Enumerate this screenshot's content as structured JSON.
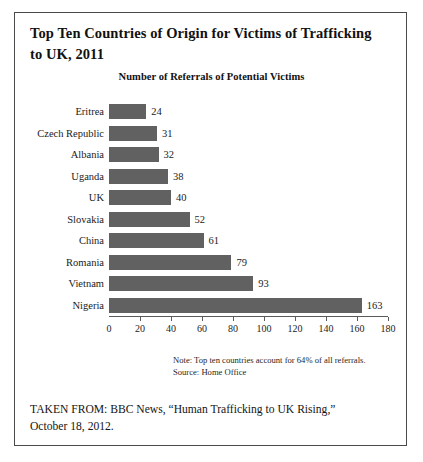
{
  "figure": {
    "title": "Top Ten Countries of Origin for Victims of Trafficking to UK, 2011",
    "note_line1": "Note: Top ten countries account for 64% of all referrals.",
    "note_line2": "Source: Home Office",
    "caption_line1": "TAKEN FROM: BBC News, “Human Trafficking to UK Rising,”",
    "caption_line2": "October 18, 2012.",
    "border_color": "#4a4a4a"
  },
  "chart_data": {
    "type": "bar",
    "orientation": "horizontal",
    "title": "Top Ten Countries of Origin for Victims of Trafficking to UK, 2011",
    "subtitle": "Number of Referrals of Potential Victims",
    "categories": [
      "Eritrea",
      "Czech Republic",
      "Albania",
      "Uganda",
      "UK",
      "Slovakia",
      "China",
      "Romania",
      "Vietnam",
      "Nigeria"
    ],
    "values": [
      24,
      31,
      32,
      38,
      40,
      52,
      61,
      79,
      93,
      163
    ],
    "value_labels": [
      "24",
      "31",
      "32",
      "38",
      "40",
      "52",
      "61",
      "79",
      "93",
      "163"
    ],
    "xlabel": "",
    "ylabel": "",
    "xlim": [
      0,
      180
    ],
    "xticks": [
      0,
      20,
      40,
      60,
      80,
      100,
      120,
      140,
      160,
      180
    ],
    "xtick_labels": [
      "0",
      "20",
      "40",
      "60",
      "80",
      "100",
      "120",
      "140",
      "160",
      "180"
    ],
    "grid": false,
    "legend": false,
    "bar_color": "#616161",
    "axis_color": "#5a5a5a",
    "annotations": [
      "Note: Top ten countries account for 64% of all referrals.",
      "Source: Home Office"
    ]
  }
}
